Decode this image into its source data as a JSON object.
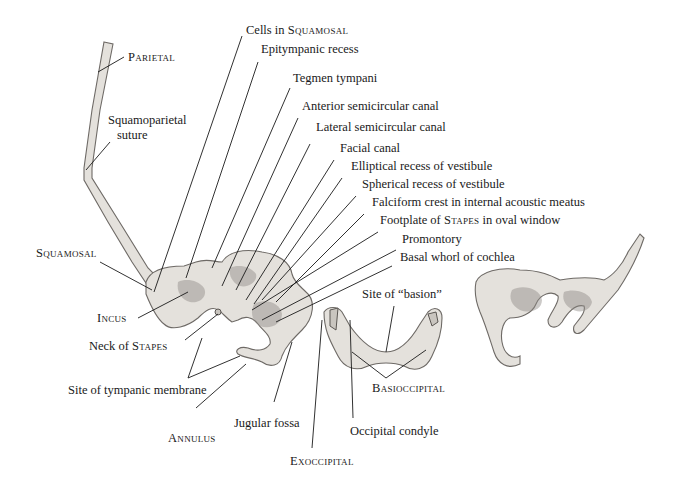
{
  "figure": {
    "labels": {
      "parietal": "Parietal",
      "squamoparietal_suture_line1": "Squamoparietal",
      "squamoparietal_suture_line2": "suture",
      "squamosal": "Squamosal",
      "incus": "Incus",
      "neck_of_stapes_prefix": "Neck of ",
      "neck_of_stapes_sc": "Stapes",
      "site_of_tympanic_membrane": "Site of tympanic membrane",
      "annulus": "Annulus",
      "jugular_fossa": "Jugular fossa",
      "exoccipital": "Exoccipital",
      "occipital_condyle": "Occipital condyle",
      "basioccipital": "Basioccipital",
      "site_of_basion": "Site of “basion”",
      "cells_in_squamosal_prefix": "Cells in ",
      "cells_in_squamosal_sc": "Squamosal",
      "epitympanic_recess": "Epitympanic recess",
      "tegmen_tympani": "Tegmen tympani",
      "anterior_semicircular_canal": "Anterior semicircular canal",
      "lateral_semicircular_canal": "Lateral semicircular canal",
      "facial_canal": "Facial canal",
      "elliptical_recess": "Elliptical recess of vestibule",
      "spherical_recess": "Spherical recess of vestibule",
      "falciform_crest": "Falciform crest in internal acoustic meatus",
      "footplate_prefix": "Footplate of ",
      "footplate_sc": "Stapes",
      "footplate_suffix": " in oval window",
      "promontory": "Promontory",
      "basal_whorl": "Basal whorl of cochlea"
    }
  }
}
